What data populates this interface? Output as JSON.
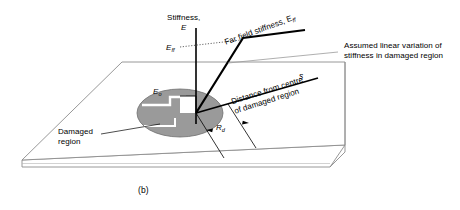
{
  "figure": {
    "caption": "(b)",
    "axis_title_line1": "Stiffness,",
    "axis_title_line2": "E",
    "far_field_label": "Far field stiffness, E",
    "far_field_sub": "ff",
    "e_ff_label": "E",
    "e_ff_sub": "ff",
    "e_o_label": "E",
    "e_o_sub": "o",
    "annotation_line1": "Assumed linear variation of",
    "annotation_line2": "stiffness in damaged region",
    "distance_line1": "Distance from centre",
    "distance_line2": "of damaged region",
    "damaged_line1": "Damaged",
    "damaged_line2": "region",
    "s_label": "s",
    "rd_label": "R",
    "rd_sub": "d",
    "colors": {
      "ink": "#000000",
      "plate_outline": "#8c8c8c",
      "damage_fill": "#9a9a9a",
      "damage_stroke": "#6e6e6e",
      "leader": "#9a9a9a",
      "dotted": "#555555"
    }
  }
}
